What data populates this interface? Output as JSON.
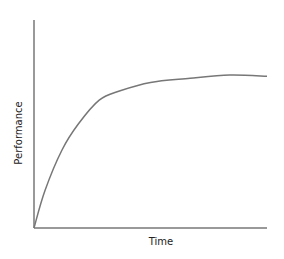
{
  "chart_data": {
    "type": "line",
    "title": "",
    "xlabel": "Time",
    "ylabel": "Performance",
    "xlim": [
      0,
      1
    ],
    "ylim": [
      0,
      1
    ],
    "grid": false,
    "legend": null,
    "ticks": {
      "x": [],
      "y": []
    },
    "series": [
      {
        "name": "Performance over time",
        "color": "#777777",
        "x": [
          0,
          0.047,
          0.12,
          0.19,
          0.28,
          0.37,
          0.5,
          0.67,
          0.84,
          1.0
        ],
        "y": [
          0,
          0.18,
          0.375,
          0.5,
          0.615,
          0.66,
          0.7,
          0.72,
          0.735,
          0.73
        ]
      }
    ]
  },
  "style": {
    "axis_color": "#777777",
    "line_color": "#777777",
    "label_color": "#222222"
  }
}
